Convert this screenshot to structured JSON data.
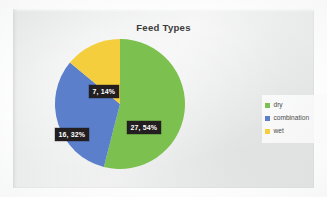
{
  "chart_data": {
    "type": "pie",
    "title": "Feed Types",
    "categories": [
      "dry",
      "combination",
      "wet"
    ],
    "values": [
      27,
      16,
      7
    ],
    "percentages": [
      54,
      32,
      14
    ],
    "data_labels": [
      "27, 54%",
      "16, 32%",
      "7, 14%"
    ],
    "colors": [
      "#7CC04F",
      "#5B7FCC",
      "#F5CE3E"
    ],
    "legend_position": "right",
    "start_angle_deg": 0,
    "direction": "clockwise",
    "grid": false,
    "xlabel": "",
    "ylabel": ""
  },
  "title": "Feed Types",
  "slices": [
    {
      "name": "dry",
      "label": "27, 54%",
      "value": 27,
      "percent": 54,
      "color": "#7CC04F"
    },
    {
      "name": "combination",
      "label": "16, 32%",
      "value": 16,
      "percent": 32,
      "color": "#5B7FCC"
    },
    {
      "name": "wet",
      "label": "7, 14%",
      "value": 7,
      "percent": 14,
      "color": "#F5CE3E"
    }
  ],
  "legend": {
    "items": [
      {
        "label": "dry",
        "color": "#7CC04F"
      },
      {
        "label": "combination",
        "color": "#5B7FCC"
      },
      {
        "label": "wet",
        "color": "#F5CE3E"
      }
    ]
  }
}
